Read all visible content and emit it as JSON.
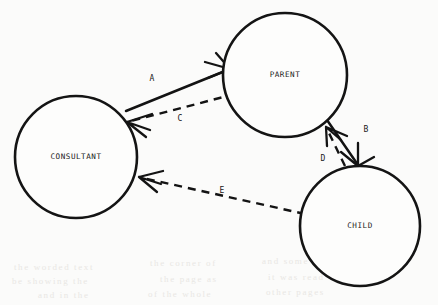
{
  "diagram": {
    "type": "node-link-diagram",
    "background_color": "#fbfbfa",
    "ink_color": "#141414",
    "nodes": [
      {
        "id": "consultant",
        "label": "CONSULTANT",
        "cx": 76,
        "cy": 157,
        "r": 61
      },
      {
        "id": "parent",
        "label": "PARENT",
        "cx": 285,
        "cy": 75,
        "r": 62
      },
      {
        "id": "child",
        "label": "CHILD",
        "cx": 360,
        "cy": 226,
        "r": 60
      }
    ],
    "edges": [
      {
        "id": "A",
        "label": "A",
        "from": "consultant",
        "to": "parent",
        "style": "solid",
        "label_x": 152,
        "label_y": 78
      },
      {
        "id": "C",
        "label": "C",
        "from": "parent",
        "to": "consultant",
        "style": "dashed",
        "label_x": 180,
        "label_y": 118
      },
      {
        "id": "B",
        "label": "B",
        "from": "parent",
        "to": "child",
        "style": "solid",
        "label_x": 366,
        "label_y": 129
      },
      {
        "id": "D",
        "label": "D",
        "from": "child",
        "to": "parent",
        "style": "dashed",
        "label_x": 323,
        "label_y": 158
      },
      {
        "id": "E",
        "label": "E",
        "from": "child",
        "to": "consultant",
        "style": "dashed",
        "label_x": 222,
        "label_y": 190
      }
    ],
    "bleed_through_lines": [
      {
        "text": "the worded text",
        "x": 14,
        "y": 262
      },
      {
        "text": "the corner of",
        "x": 150,
        "y": 258
      },
      {
        "text": "and some of",
        "x": 262,
        "y": 256
      },
      {
        "text": "be showing the",
        "x": 12,
        "y": 276
      },
      {
        "text": "the page as",
        "x": 160,
        "y": 274
      },
      {
        "text": "it was read",
        "x": 268,
        "y": 272
      },
      {
        "text": "and in the",
        "x": 38,
        "y": 290
      },
      {
        "text": "of the whole",
        "x": 148,
        "y": 289
      },
      {
        "text": "other pages",
        "x": 266,
        "y": 287
      }
    ]
  }
}
